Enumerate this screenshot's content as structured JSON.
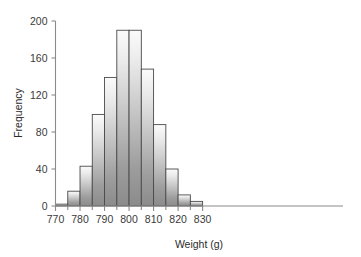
{
  "chart_data": {
    "type": "bar",
    "subtype": "histogram",
    "title": "",
    "xlabel": "Weight (g)",
    "ylabel": "Frequency",
    "xlim": [
      768,
      836
    ],
    "ylim": [
      0,
      200
    ],
    "grid": false,
    "legend": null,
    "bin_width": 5,
    "bin_edges": [
      770,
      775,
      780,
      785,
      790,
      795,
      800,
      805,
      810,
      815,
      820,
      825,
      830
    ],
    "categories": [
      "770-775",
      "775-780",
      "780-785",
      "785-790",
      "790-795",
      "795-800",
      "800-805",
      "805-810",
      "810-815",
      "815-820",
      "820-825",
      "825-830"
    ],
    "values": [
      2,
      16,
      43,
      99,
      139,
      190,
      190,
      148,
      88,
      40,
      12,
      5
    ],
    "xticks": [
      770,
      780,
      790,
      800,
      810,
      820,
      830
    ],
    "xtick_labels": [
      "770",
      "780",
      "790",
      "800",
      "810",
      "820",
      "830"
    ],
    "xminor_ticks": [
      775,
      785,
      795,
      805,
      815,
      825
    ],
    "yticks": [
      0,
      40,
      80,
      120,
      160,
      200
    ],
    "ytick_labels": [
      "0",
      "40",
      "80",
      "120",
      "160",
      "200"
    ],
    "colors": {
      "bar_fill_top": "#f6f6f6",
      "bar_fill_bottom": "#8d8d8d",
      "bar_edge": "#4a4a4a",
      "axis": "#8a8a8a",
      "text": "#2b2b2b",
      "background": "#ffffff"
    }
  }
}
